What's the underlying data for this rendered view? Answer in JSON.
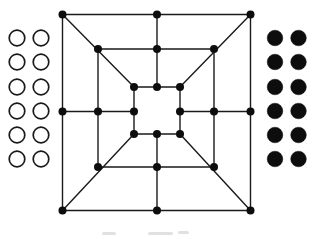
{
  "figure": {
    "background": "#ffffff",
    "ink": "#1a1a1a"
  },
  "board": {
    "line_color": "#1a1a1a",
    "line_width": 1.4,
    "dot_color": "#0d0d0d",
    "dot_radius": 4,
    "lines": [
      [
        62.5,
        14.5,
        250.5,
        14.5
      ],
      [
        250.5,
        14.5,
        250.5,
        210.5
      ],
      [
        62.5,
        210.5,
        250.5,
        210.5
      ],
      [
        62.5,
        14.5,
        62.5,
        210.5
      ],
      [
        98,
        49,
        214,
        49
      ],
      [
        214,
        49,
        214,
        167
      ],
      [
        98,
        167,
        214,
        167
      ],
      [
        98,
        49,
        98,
        167
      ],
      [
        134,
        87,
        180,
        87
      ],
      [
        180,
        87,
        180,
        134
      ],
      [
        134,
        134,
        180,
        134
      ],
      [
        134,
        87,
        134,
        134
      ],
      [
        157,
        14.5,
        157,
        87
      ],
      [
        157,
        134,
        157,
        210.5
      ],
      [
        62.5,
        111.5,
        134,
        111.5
      ],
      [
        180,
        111.5,
        250.5,
        111.5
      ],
      [
        62.5,
        14.5,
        134,
        87
      ],
      [
        250.5,
        14.5,
        180,
        87
      ],
      [
        62.5,
        210.5,
        134,
        134
      ],
      [
        250.5,
        210.5,
        180,
        134
      ]
    ],
    "points": [
      {
        "id": "outer-top-left",
        "x": 62.5,
        "y": 14.5
      },
      {
        "id": "outer-top-mid",
        "x": 157,
        "y": 14.5
      },
      {
        "id": "outer-top-right",
        "x": 250.5,
        "y": 14.5
      },
      {
        "id": "outer-mid-left",
        "x": 62.5,
        "y": 111.5
      },
      {
        "id": "outer-mid-right",
        "x": 250.5,
        "y": 111.5
      },
      {
        "id": "outer-bottom-left",
        "x": 62.5,
        "y": 210.5
      },
      {
        "id": "outer-bottom-mid",
        "x": 157,
        "y": 210.5
      },
      {
        "id": "outer-bottom-right",
        "x": 250.5,
        "y": 210.5
      },
      {
        "id": "middle-top-left",
        "x": 98,
        "y": 49
      },
      {
        "id": "middle-top-mid",
        "x": 157,
        "y": 49
      },
      {
        "id": "middle-top-right",
        "x": 214,
        "y": 49
      },
      {
        "id": "middle-mid-left",
        "x": 98,
        "y": 111.5
      },
      {
        "id": "middle-mid-right",
        "x": 214,
        "y": 111.5
      },
      {
        "id": "middle-bottom-left",
        "x": 98,
        "y": 167
      },
      {
        "id": "middle-bottom-mid",
        "x": 157,
        "y": 167
      },
      {
        "id": "middle-bottom-right",
        "x": 214,
        "y": 167
      },
      {
        "id": "inner-top-left",
        "x": 134,
        "y": 87
      },
      {
        "id": "inner-top-mid",
        "x": 157,
        "y": 87
      },
      {
        "id": "inner-top-right",
        "x": 180,
        "y": 87
      },
      {
        "id": "inner-mid-left",
        "x": 134,
        "y": 111.5
      },
      {
        "id": "inner-mid-right",
        "x": 180,
        "y": 111.5
      },
      {
        "id": "inner-bottom-left",
        "x": 134,
        "y": 134
      },
      {
        "id": "inner-bottom-mid",
        "x": 157,
        "y": 134
      },
      {
        "id": "inner-bottom-right",
        "x": 180,
        "y": 134
      }
    ]
  },
  "pieces": {
    "left": {
      "style": "open",
      "count": 12,
      "fill": "#ffffff",
      "stroke": "#1a1a1a",
      "stroke_width": 1.7,
      "radius": 7.8,
      "cols": [
        17,
        41
      ],
      "rows": [
        38,
        62,
        87,
        111,
        135,
        159
      ]
    },
    "right": {
      "style": "filled",
      "count": 12,
      "fill": "#0d0d0d",
      "stroke": "#0d0d0d",
      "stroke_width": 0.5,
      "radius": 7.8,
      "cols": [
        275,
        298.5
      ],
      "rows": [
        38,
        62,
        87,
        111,
        135,
        159
      ]
    }
  },
  "caption_marks": {
    "color": "#d9d9d9",
    "marks": [
      {
        "x": 102,
        "y": 232,
        "w": 14,
        "h": 3
      },
      {
        "x": 148,
        "y": 232,
        "w": 25,
        "h": 3
      },
      {
        "x": 178,
        "y": 231,
        "w": 11,
        "h": 3
      }
    ]
  }
}
